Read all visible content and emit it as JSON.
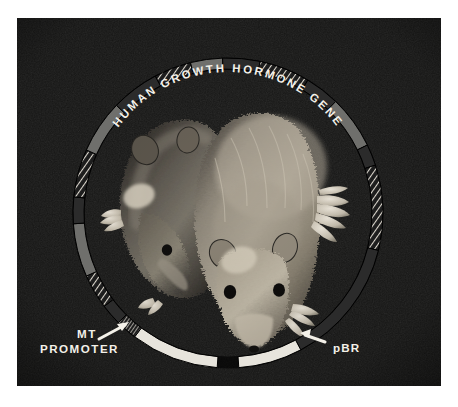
{
  "figure": {
    "kind": "photograph-with-plasmid-diagram-overlay",
    "plate": {
      "background_color": "#141414",
      "left": 17,
      "top": 18,
      "width": 424,
      "height": 368
    }
  },
  "diagram": {
    "name": "plasmid-construct-ring",
    "center": {
      "x": 211,
      "y": 195
    },
    "outer_radius": 155,
    "ring_thickness": 11,
    "colors": {
      "light_segment": "#e7e4dc",
      "mid_segment": "#6f6f6c",
      "dark_segment": "#2b2b2b",
      "hatch_stroke": "#d8d5cd",
      "outline": "#000000",
      "label_text": "#f2efe7",
      "arrow": "#f2efe7"
    },
    "segments": [
      {
        "id": "seg-hgh-hatch-top-left",
        "style": "hatched",
        "start_deg": -118,
        "end_deg": -104
      },
      {
        "id": "seg-hgh-mid-1",
        "style": "mid",
        "start_deg": -104,
        "end_deg": -92
      },
      {
        "id": "seg-hgh-dark-1",
        "style": "dark",
        "start_deg": -92,
        "end_deg": -78
      },
      {
        "id": "seg-hgh-hatch-top-mid",
        "style": "hatched",
        "start_deg": -78,
        "end_deg": -59
      },
      {
        "id": "seg-hgh-dark-2",
        "style": "dark",
        "start_deg": -59,
        "end_deg": -46
      },
      {
        "id": "seg-hgh-mid-2",
        "style": "mid",
        "start_deg": -46,
        "end_deg": -26
      },
      {
        "id": "seg-dark-upper-right",
        "style": "dark",
        "start_deg": -26,
        "end_deg": -18
      },
      {
        "id": "seg-hatch-right",
        "style": "hatched",
        "start_deg": -18,
        "end_deg": 14
      },
      {
        "id": "seg-dark-right",
        "style": "dark",
        "start_deg": 14,
        "end_deg": 62
      },
      {
        "id": "seg-pbr-light",
        "style": "light",
        "start_deg": 62,
        "end_deg": 86
      },
      {
        "id": "seg-gap-bottom",
        "style": "gap",
        "start_deg": 86,
        "end_deg": 94
      },
      {
        "id": "seg-mt-light",
        "style": "light",
        "start_deg": 94,
        "end_deg": 127
      },
      {
        "id": "seg-hatch-fine-lower-left",
        "style": "hatched",
        "start_deg": 127,
        "end_deg": 135
      },
      {
        "id": "seg-dark-lower-left",
        "style": "dark",
        "start_deg": 135,
        "end_deg": 143
      },
      {
        "id": "seg-hatch-lower-left",
        "style": "hatched",
        "start_deg": 143,
        "end_deg": 156
      },
      {
        "id": "seg-mid-left-lower",
        "style": "mid",
        "start_deg": 156,
        "end_deg": 176
      },
      {
        "id": "seg-dark-left",
        "style": "dark",
        "start_deg": 176,
        "end_deg": 186
      },
      {
        "id": "seg-hatch-left",
        "style": "hatched",
        "start_deg": 186,
        "end_deg": 204
      },
      {
        "id": "seg-mid-left-upper",
        "style": "mid",
        "start_deg": 204,
        "end_deg": 224
      },
      {
        "id": "seg-dark-upper-left",
        "style": "dark",
        "start_deg": 224,
        "end_deg": 242
      }
    ]
  },
  "labels": {
    "gene_title": "HUMAN GROWTH HORMONE GENE",
    "mt_line1": "MT",
    "mt_line2": "PROMOTER",
    "pbr": "pBR"
  }
}
